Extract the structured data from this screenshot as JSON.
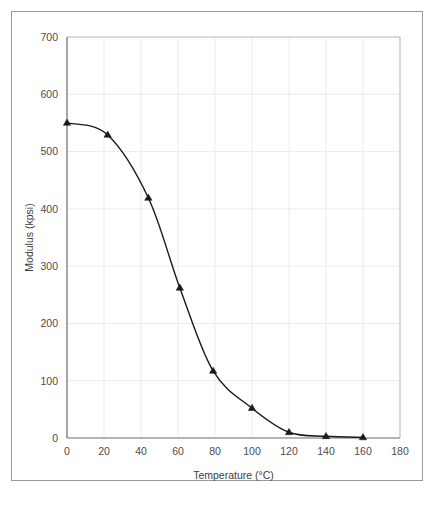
{
  "chart_data": {
    "type": "line",
    "title": "",
    "subtitle": "",
    "xlabel": "Temperature (°C)",
    "ylabel": "Modulus (kpsi)",
    "xlim": [
      0,
      180
    ],
    "ylim": [
      0,
      700
    ],
    "xticks": [
      0,
      20,
      40,
      60,
      80,
      100,
      120,
      140,
      160,
      180
    ],
    "yticks": [
      0,
      100,
      200,
      300,
      400,
      500,
      600,
      700
    ],
    "xtick_labels": [
      "0",
      "20",
      "40",
      "60",
      "80",
      "100",
      "120",
      "140",
      "160",
      "180"
    ],
    "ytick_labels": [
      "0",
      "100",
      "200",
      "300",
      "400",
      "500",
      "600",
      "700"
    ],
    "grid": true,
    "legend": false,
    "legend_position": "none",
    "marker": "triangle",
    "marker_color": "#1a1a1a",
    "line_color": "#1a1a1a",
    "series": [
      {
        "name": "Modulus vs Temperature",
        "x": [
          0,
          22,
          44,
          61,
          79,
          100,
          120,
          140,
          160
        ],
        "values": [
          550,
          529,
          419,
          262,
          117,
          52,
          10,
          3,
          1
        ]
      }
    ],
    "annotations": []
  },
  "axis_labels": {
    "x_title": "Temperature (°C)",
    "y_title": "Modulus (kpsi)"
  },
  "colors": {
    "frame": "#9a9a9a",
    "axis": "#6b6b6b",
    "grid": "#ececec",
    "data": "#1a1a1a",
    "tick_text": "#4d4d4d",
    "background": "#ffffff"
  }
}
